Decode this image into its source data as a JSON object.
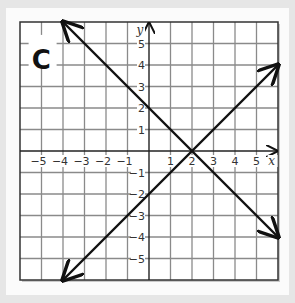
{
  "panel_label": "C",
  "chart_data": {
    "type": "line",
    "title": "",
    "panel_label": "C",
    "xlabel": "x",
    "ylabel": "y",
    "xlim": [
      -6,
      6
    ],
    "ylim": [
      -6,
      6
    ],
    "grid": true,
    "x_ticks": [
      -5,
      -4,
      -3,
      -2,
      -1,
      1,
      2,
      3,
      4,
      5
    ],
    "y_ticks": [
      -5,
      -4,
      -3,
      -2,
      -1,
      1,
      2,
      3,
      4,
      5
    ],
    "series": [
      {
        "name": "y = -x + 2",
        "x": [
          -4,
          6
        ],
        "y": [
          6,
          -4
        ],
        "arrows": "both"
      },
      {
        "name": "y = x - 2",
        "x": [
          -4,
          6
        ],
        "y": [
          -6,
          4
        ],
        "arrows": "both"
      }
    ],
    "intersection": {
      "x": 2,
      "y": 0
    }
  },
  "colors": {
    "grid": "#8a8a8a",
    "axis": "#222222",
    "line": "#111111",
    "frame": "#333333"
  }
}
